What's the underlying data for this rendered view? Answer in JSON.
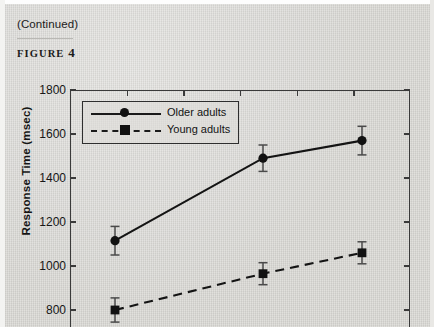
{
  "page": {
    "continued_note": "(Continued)",
    "figure_label": "FIGURE",
    "figure_number": "4",
    "background_color": "#d8d7d3"
  },
  "chart_data": {
    "type": "line",
    "title": "",
    "xlabel": "",
    "ylabel": "Response Time (msec)",
    "ylim": [
      700,
      1800
    ],
    "yticks": [
      1800,
      1600,
      1400,
      1200,
      1000,
      800
    ],
    "ytick_labels": [
      "1800",
      "1600",
      "1400",
      "1200",
      "1000",
      "800"
    ],
    "x": [
      1,
      2,
      3
    ],
    "xticks_count": 6,
    "grid": false,
    "legend_position": "upper-left-inside",
    "series": [
      {
        "name": "Older adults",
        "style": "solid",
        "marker": "circle",
        "color": "#111111",
        "values": [
          1115,
          1490,
          1570
        ],
        "errors": [
          65,
          60,
          65
        ]
      },
      {
        "name": "Young adults",
        "style": "dashed",
        "marker": "square",
        "color": "#111111",
        "values": [
          800,
          965,
          1060
        ],
        "errors": [
          55,
          50,
          50
        ]
      }
    ]
  }
}
